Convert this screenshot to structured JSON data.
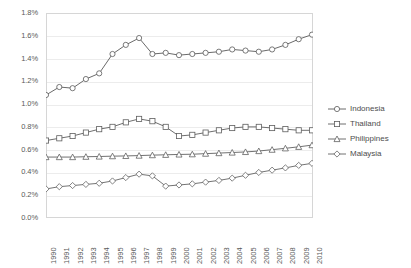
{
  "chart_data": {
    "type": "line",
    "title": "",
    "subtitle": "",
    "xlabel": "",
    "ylabel": "",
    "grid": true,
    "legend_position": "right",
    "xlim": [
      1990,
      2010
    ],
    "ylim": [
      0.0,
      1.8
    ],
    "ytick_step": 0.2,
    "value_suffix": "%",
    "x": [
      1990,
      1991,
      1992,
      1993,
      1994,
      1995,
      1996,
      1997,
      1998,
      1999,
      2000,
      2001,
      2002,
      2003,
      2004,
      2005,
      2006,
      2007,
      2008,
      2009,
      2010
    ],
    "categories": [
      "1990",
      "1991",
      "1992",
      "1993",
      "1994",
      "1995",
      "1996",
      "1997",
      "1998",
      "1999",
      "2000",
      "2001",
      "2002",
      "2003",
      "2004",
      "2005",
      "2006",
      "2007",
      "2008",
      "2009",
      "2010"
    ],
    "ytick_labels": [
      "0.0%",
      "0.2%",
      "0.4%",
      "0.6%",
      "0.8%",
      "1.0%",
      "1.2%",
      "1.4%",
      "1.6%",
      "1.8%"
    ],
    "ytick_values": [
      0.0,
      0.2,
      0.4,
      0.6,
      0.8,
      1.0,
      1.2,
      1.4,
      1.6,
      1.8
    ],
    "series": [
      {
        "name": "Indonesia",
        "marker": "circle",
        "color": "#595959",
        "values": [
          1.08,
          1.15,
          1.14,
          1.22,
          1.27,
          1.44,
          1.52,
          1.58,
          1.44,
          1.45,
          1.43,
          1.44,
          1.45,
          1.46,
          1.48,
          1.47,
          1.46,
          1.48,
          1.52,
          1.57,
          1.61
        ]
      },
      {
        "name": "Thailand",
        "marker": "square",
        "color": "#5e5e5e",
        "values": [
          0.68,
          0.7,
          0.72,
          0.75,
          0.78,
          0.8,
          0.84,
          0.87,
          0.85,
          0.8,
          0.72,
          0.73,
          0.75,
          0.77,
          0.79,
          0.8,
          0.8,
          0.79,
          0.78,
          0.77,
          0.77
        ]
      },
      {
        "name": "Philippines",
        "marker": "triangle",
        "color": "#616161",
        "values": [
          0.535,
          0.535,
          0.535,
          0.538,
          0.54,
          0.543,
          0.545,
          0.548,
          0.552,
          0.555,
          0.558,
          0.56,
          0.565,
          0.57,
          0.575,
          0.58,
          0.588,
          0.6,
          0.612,
          0.625,
          0.64
        ]
      },
      {
        "name": "Malaysia",
        "marker": "diamond",
        "color": "#636363",
        "values": [
          0.255,
          0.275,
          0.285,
          0.295,
          0.305,
          0.325,
          0.355,
          0.385,
          0.37,
          0.28,
          0.29,
          0.3,
          0.315,
          0.33,
          0.35,
          0.375,
          0.4,
          0.42,
          0.44,
          0.462,
          0.48
        ]
      }
    ]
  },
  "legend": {
    "items": [
      {
        "label": "Indonesia",
        "marker": "circle"
      },
      {
        "label": "Thailand",
        "marker": "square"
      },
      {
        "label": "Philippines",
        "marker": "triangle"
      },
      {
        "label": "Malaysia",
        "marker": "diamond"
      }
    ]
  },
  "colors": {
    "line": "#5e5e5e",
    "grid": "#ececec",
    "frame": "#d6d6d6",
    "text": "#595959"
  }
}
